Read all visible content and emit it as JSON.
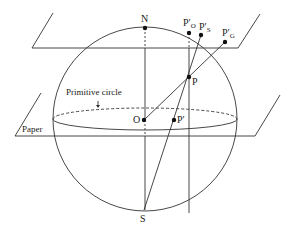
{
  "diagram": {
    "labels": {
      "N": "N",
      "S": "S",
      "O": "O",
      "P": "P",
      "P_prime": "P′",
      "P_O": "P′",
      "P_O_sub": "O",
      "P_S": "P′",
      "P_S_sub": "S",
      "P_G": "P′",
      "P_G_sub": "G",
      "primitive_circle": "Primitive circle",
      "paper": "Paper"
    },
    "colors": {
      "line": "#333333",
      "background": "#ffffff"
    }
  }
}
